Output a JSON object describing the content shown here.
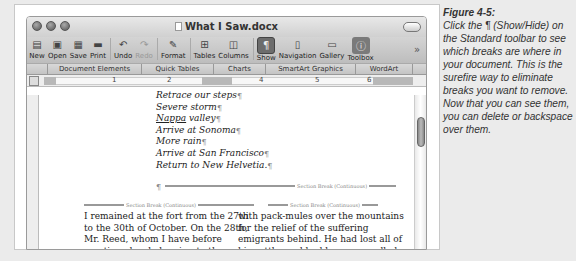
{
  "window": {
    "title": "What I Saw.docx"
  },
  "toolbar": {
    "items": [
      {
        "label": "New",
        "icon": "new-document-icon"
      },
      {
        "label": "Open",
        "icon": "open-icon"
      },
      {
        "label": "Save",
        "icon": "save-icon"
      },
      {
        "label": "Print",
        "icon": "print-icon"
      },
      {
        "label": "Undo",
        "icon": "undo-icon"
      },
      {
        "label": "Redo",
        "icon": "redo-icon"
      },
      {
        "label": "Format",
        "icon": "format-painter-icon"
      },
      {
        "label": "Tables",
        "icon": "tables-icon"
      },
      {
        "label": "Columns",
        "icon": "columns-icon"
      },
      {
        "label": "Show",
        "icon": "pilcrow-icon",
        "active": true
      },
      {
        "label": "Navigation",
        "icon": "navigation-icon"
      },
      {
        "label": "Gallery",
        "icon": "gallery-icon"
      },
      {
        "label": "Toolbox",
        "icon": "toolbox-icon"
      }
    ],
    "overflow": "»"
  },
  "ribbon": {
    "tabs": [
      "Document Elements",
      "Quick Tables",
      "Charts",
      "SmartArt Graphics",
      "WordArt"
    ]
  },
  "ruler": {
    "numbers": [
      "1",
      "2",
      "3",
      "4",
      "5",
      "6"
    ]
  },
  "document": {
    "list_items": [
      "Retrace our steps",
      "Severe storm",
      "Nappa valley",
      "Arrive at Sonoma",
      "More rain",
      "Arrive at San Francisco",
      "Return to New Helvetia."
    ],
    "pilcrow": "¶",
    "section_break": "Section Break (Continuous)",
    "column1": "I remained at the fort from the 27th to the 30th of October. On the 28th, Mr. Reed, whom I have before mentioned as belonging to the rear emigrating party, arrived here. He left his party on Mary's River, and in",
    "column2": "with pack-mules over the mountains for the relief of the suffering emigrants behind. He had lost all of his cattle, and had been compelled to cache two of his wagons and most of his property. Captain Sutter"
  },
  "caption": {
    "heading": "Figure 4-5:",
    "body": "Click the ¶ (Show/Hide) on the Standard toolbar to see which breaks are where in your document. This is the surefire way to eliminate breaks you want to remove. Now that you can see them, you can delete or backspace over them."
  }
}
